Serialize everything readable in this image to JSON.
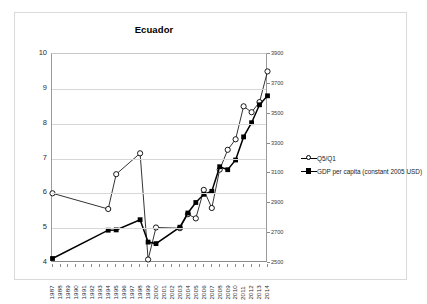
{
  "chart_data": {
    "type": "line",
    "title": "Ecuador",
    "xlabel": "",
    "ylabel": "",
    "grid": true,
    "legend_position": "right",
    "x": [
      1987,
      1988,
      1989,
      1990,
      1991,
      1992,
      1993,
      1994,
      1995,
      1996,
      1997,
      1998,
      1999,
      2000,
      2001,
      2002,
      2003,
      2004,
      2005,
      2006,
      2007,
      2008,
      2009,
      2010,
      2011,
      2012,
      2013,
      2014
    ],
    "categories": [
      "1987",
      "1988",
      "1989",
      "1990",
      "1991",
      "1992",
      "1993",
      "1994",
      "1995",
      "1996",
      "1997",
      "1998",
      "1999",
      "2000",
      "2001",
      "2002",
      "2003",
      "2004",
      "2005",
      "2006",
      "2007",
      "2008",
      "2009",
      "2010",
      "2011",
      "2012",
      "2013",
      "2014"
    ],
    "axes": {
      "left": {
        "label": "",
        "ylim": [
          4,
          10
        ],
        "ticks": [
          "4",
          "5",
          "6",
          "7",
          "8",
          "9",
          "10"
        ],
        "tick_values": [
          4,
          5,
          6,
          7,
          8,
          9,
          10
        ]
      },
      "right": {
        "label": "",
        "ylim": [
          2500,
          3900
        ],
        "ticks": [
          "2500",
          "2700",
          "2900",
          "3100",
          "3300",
          "3500",
          "3700",
          "3900"
        ],
        "tick_values": [
          2500,
          2700,
          2900,
          3100,
          3300,
          3500,
          3700,
          3900
        ]
      }
    },
    "series": [
      {
        "name": "Q5/Q1",
        "axis": "left",
        "marker": "open-circle",
        "color": "#000000",
        "values": [
          6.0,
          null,
          null,
          null,
          null,
          null,
          null,
          5.55,
          6.55,
          null,
          null,
          7.15,
          4.1,
          5.02,
          null,
          null,
          5.0,
          5.4,
          5.28,
          6.1,
          5.58,
          6.68,
          7.25,
          7.55,
          8.5,
          8.33,
          8.62,
          9.5
        ]
      },
      {
        "name": "GDP per capita (constant 2005 USD)",
        "axis": "right",
        "marker": "filled-square",
        "color": "#000000",
        "values": [
          2530,
          null,
          null,
          null,
          null,
          null,
          null,
          2720,
          2722,
          null,
          null,
          2790,
          2640,
          2630,
          null,
          null,
          2740,
          2835,
          2905,
          2960,
          2980,
          3145,
          3125,
          3190,
          3345,
          3440,
          3560,
          3620
        ]
      }
    ]
  },
  "legend": {
    "items": [
      {
        "label": "Q5/Q1",
        "marker": "open-circle"
      },
      {
        "label": "GDP per capita (constant 2005 USD)",
        "marker": "filled-square"
      }
    ]
  }
}
